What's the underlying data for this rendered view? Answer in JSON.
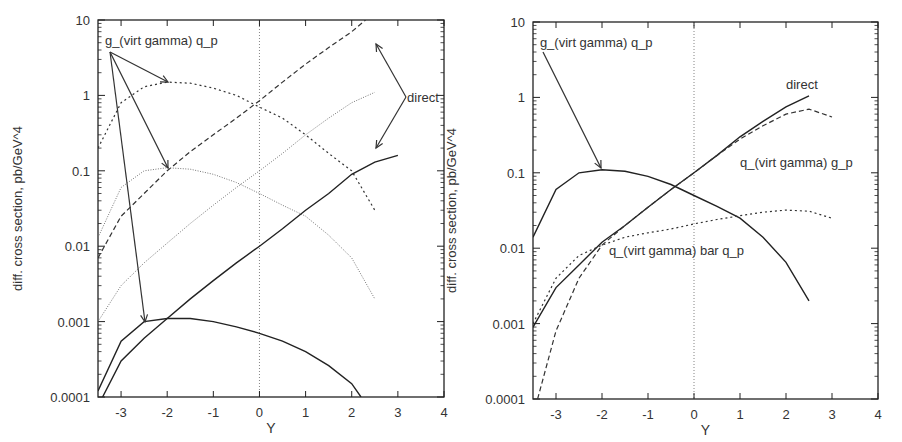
{
  "chart_data": [
    {
      "type": "line",
      "title": "",
      "xlabel": "Y",
      "ylabel": "diff. cross section, pb/GeV^4",
      "xlim": [
        -3.5,
        4
      ],
      "ylim": [
        0.0001,
        10
      ],
      "yscale": "log",
      "grid": false,
      "x_ticks": [
        "-3",
        "-2",
        "-1",
        "0",
        "1",
        "2",
        "3",
        "4"
      ],
      "y_ticks": [
        "0.0001",
        "0.001",
        "0.01",
        "0.1",
        "1",
        "10"
      ],
      "annotations": [
        {
          "text": "g_(virt gamma) q_p",
          "x": -3.35,
          "y": 5.5
        },
        {
          "text": "direct",
          "x": 3.2,
          "y": 0.95
        }
      ],
      "series": [
        {
          "name": "direct (dashed, steep)",
          "style": "dashed",
          "x": [
            -3.5,
            -3,
            -2.5,
            -2,
            -1.5,
            -1,
            -0.5,
            0,
            0.5,
            1,
            1.5,
            2,
            2.3
          ],
          "y": [
            0.007,
            0.025,
            0.05,
            0.1,
            0.18,
            0.3,
            0.5,
            0.85,
            1.5,
            2.6,
            4.3,
            7,
            10
          ]
        },
        {
          "name": "g_(virt gamma) q_p (dotted, high)",
          "style": "dotted",
          "x": [
            -3.5,
            -3,
            -2.5,
            -2,
            -1.5,
            -1,
            -0.5,
            0,
            0.5,
            1,
            1.5,
            2,
            2.5
          ],
          "y": [
            0.2,
            0.8,
            1.3,
            1.5,
            1.45,
            1.25,
            1.0,
            0.7,
            0.5,
            0.3,
            0.17,
            0.1,
            0.03
          ]
        },
        {
          "name": "g_(virt gamma) q_p (fine dotted, mid)",
          "style": "fine-dotted",
          "x": [
            -3.5,
            -3,
            -2.5,
            -2,
            -1.5,
            -1,
            -0.5,
            0,
            0.5,
            1,
            1.5,
            2,
            2.5
          ],
          "y": [
            0.013,
            0.06,
            0.1,
            0.11,
            0.105,
            0.09,
            0.07,
            0.05,
            0.035,
            0.025,
            0.014,
            0.007,
            0.002
          ]
        },
        {
          "name": "direct (fine dotted, rising)",
          "style": "fine-dotted",
          "x": [
            -3.5,
            -3,
            -2.5,
            -2,
            -1.5,
            -1,
            -0.5,
            0,
            0.5,
            1,
            1.5,
            2,
            2.5
          ],
          "y": [
            0.001,
            0.003,
            0.006,
            0.011,
            0.02,
            0.035,
            0.06,
            0.1,
            0.17,
            0.3,
            0.5,
            0.8,
            1.1
          ]
        },
        {
          "name": "direct (solid, rising)",
          "style": "solid",
          "x": [
            -3.4,
            -3,
            -2.5,
            -2,
            -1.5,
            -1,
            -0.5,
            0,
            0.5,
            1,
            1.5,
            2,
            2.5,
            3
          ],
          "y": [
            0.0001,
            0.0003,
            0.0006,
            0.0011,
            0.002,
            0.0035,
            0.006,
            0.01,
            0.017,
            0.03,
            0.05,
            0.09,
            0.13,
            0.16
          ]
        },
        {
          "name": "g_(virt gamma) q_p (solid, low)",
          "style": "solid",
          "x": [
            -3.5,
            -3,
            -2.5,
            -2,
            -1.5,
            -1,
            -0.5,
            0,
            0.5,
            1,
            1.5,
            2,
            2.2
          ],
          "y": [
            0.00012,
            0.00055,
            0.001,
            0.0011,
            0.0011,
            0.001,
            0.00085,
            0.0007,
            0.00055,
            0.0004,
            0.00026,
            0.00015,
            0.0001
          ]
        }
      ]
    },
    {
      "type": "line",
      "title": "",
      "xlabel": "Y",
      "ylabel": "diff. cross section, pb/GeV^4",
      "xlim": [
        -3.5,
        4
      ],
      "ylim": [
        0.0001,
        10
      ],
      "yscale": "log",
      "grid": false,
      "x_ticks": [
        "-3",
        "-2",
        "-1",
        "0",
        "1",
        "2",
        "3",
        "4"
      ],
      "y_ticks": [
        "0.0001",
        "0.001",
        "0.01",
        "0.1",
        "1",
        "10"
      ],
      "annotations": [
        {
          "text": "g_(virt gamma) q_p",
          "x": -3.35,
          "y": 5.5
        },
        {
          "text": "direct",
          "x": 2.0,
          "y": 1.5
        },
        {
          "text": "q_(virt gamma) g_p",
          "x": 1.0,
          "y": 0.14
        },
        {
          "text": "q_(virt gamma) bar q_p",
          "x": -1.85,
          "y": 0.0095
        }
      ],
      "series": [
        {
          "name": "g_(virt gamma) q_p",
          "style": "solid",
          "x": [
            -3.5,
            -3,
            -2.5,
            -2,
            -1.5,
            -1,
            -0.5,
            0,
            0.5,
            1,
            1.5,
            2,
            2.5
          ],
          "y": [
            0.014,
            0.06,
            0.1,
            0.11,
            0.105,
            0.09,
            0.07,
            0.05,
            0.036,
            0.025,
            0.014,
            0.0065,
            0.002
          ]
        },
        {
          "name": "direct",
          "style": "solid",
          "x": [
            -3.5,
            -3,
            -2.5,
            -2,
            -1.5,
            -1,
            -0.5,
            0,
            0.5,
            1,
            1.5,
            2,
            2.5
          ],
          "y": [
            0.0009,
            0.003,
            0.006,
            0.012,
            0.02,
            0.035,
            0.06,
            0.1,
            0.17,
            0.3,
            0.48,
            0.75,
            1.05
          ]
        },
        {
          "name": "q_(virt gamma) g_p",
          "style": "dashed",
          "x": [
            -3.4,
            -3,
            -2.5,
            -2,
            -1.5,
            -1,
            -0.5,
            0,
            0.5,
            1,
            1.5,
            2,
            2.5,
            3
          ],
          "y": [
            0.0001,
            0.0008,
            0.004,
            0.011,
            0.02,
            0.035,
            0.06,
            0.1,
            0.17,
            0.28,
            0.42,
            0.6,
            0.7,
            0.55
          ]
        },
        {
          "name": "q_(virt gamma) bar q_p",
          "style": "dotted",
          "x": [
            -3.5,
            -3,
            -2.5,
            -2,
            -1.5,
            -1,
            -0.5,
            0,
            0.5,
            1,
            1.5,
            2,
            2.5,
            3
          ],
          "y": [
            0.001,
            0.004,
            0.008,
            0.011,
            0.014,
            0.016,
            0.018,
            0.021,
            0.024,
            0.027,
            0.03,
            0.032,
            0.031,
            0.025
          ]
        }
      ]
    }
  ]
}
